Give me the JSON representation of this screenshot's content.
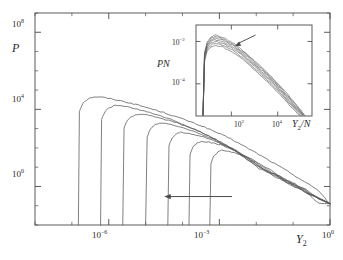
{
  "figure": {
    "type": "scientific-plot",
    "background": "#ffffff",
    "line_color": "#555555",
    "axis_color": "#4a4a4a"
  },
  "main_plot": {
    "ylabel": "P",
    "xlabel_base": "Y",
    "xlabel_sub": "2",
    "y_ticks": [
      {
        "mantissa": "10",
        "exp": "8",
        "value": 100000000.0
      },
      {
        "mantissa": "10",
        "exp": "4",
        "value": 10000.0
      },
      {
        "mantissa": "10",
        "exp": "0",
        "value": 1.0
      }
    ],
    "x_ticks": [
      {
        "mantissa": "10",
        "exp": "−6",
        "value": 1e-06
      },
      {
        "mantissa": "10",
        "exp": "−3",
        "value": 0.001
      },
      {
        "mantissa": "10",
        "exp": "0",
        "value": 1.0
      }
    ],
    "arrow": {
      "name": "increasing-n-arrow",
      "direction": "left"
    }
  },
  "inset_plot": {
    "ylabel_base": "PN",
    "xlabel_base": "Y",
    "xlabel_sub": "2",
    "xlabel_suffix": "/N",
    "y_ticks": [
      {
        "mantissa": "10",
        "exp": "−2",
        "value": 0.01
      },
      {
        "mantissa": "10",
        "exp": "−4",
        "value": 0.0001
      }
    ],
    "x_ticks": [
      {
        "mantissa": "10",
        "exp": "2",
        "value": 100.0
      },
      {
        "mantissa": "10",
        "exp": "4",
        "value": 10000.0
      }
    ],
    "arrow": {
      "name": "collapse-arrow",
      "direction": "down-left"
    }
  },
  "chart_data": {
    "type": "line",
    "title": "",
    "xlabel": "Y_2",
    "ylabel": "P",
    "xscale": "log",
    "yscale": "log",
    "xlim": [
      1e-08,
      1.0
    ],
    "ylim": [
      0.01,
      1000000000.0
    ],
    "grid": false,
    "legend": "none",
    "annotations": [
      {
        "text": "arrow pointing left, indicating increasing N",
        "x": 1e-05,
        "y": 0.3
      },
      {
        "text": "inset arrow pointing down-left at collapsed curve bundle"
      }
    ],
    "series": [
      {
        "name": "N1",
        "cutoff_x": 1.5e-07,
        "peak_x": 4e-07,
        "peak_y": 45000.0,
        "x": [
          1.5e-07,
          1.6e-07,
          2e-07,
          2.8e-07,
          4e-07,
          7e-07,
          1.5e-06,
          4e-06,
          1e-05,
          3e-05,
          0.0001,
          0.0004,
          0.002,
          0.01,
          0.06,
          0.2,
          0.5,
          1.0
        ],
        "y": [
          0.01,
          8000.0,
          22000.0,
          36000.0,
          45000.0,
          42000.0,
          32000.0,
          21000.0,
          13000.0,
          7000.0,
          3200.0,
          1200.0,
          300.0,
          55.0,
          7.5,
          1.8,
          0.6,
          0.12
        ]
      },
      {
        "name": "N2",
        "cutoff_x": 6e-07,
        "peak_x": 1.5e-06,
        "peak_y": 16000.0,
        "x": [
          6e-07,
          6.4e-07,
          8e-07,
          1.1e-06,
          1.5e-06,
          2.6e-06,
          6e-06,
          1.5e-05,
          5e-05,
          0.00015,
          0.0006,
          0.0025,
          0.012,
          0.06,
          0.2,
          0.5,
          1.0
        ],
        "y": [
          0.01,
          3000.0,
          8000.0,
          13000.0,
          16000.0,
          14500.0,
          10000.0,
          6200.0,
          2900.0,
          1250.0,
          360.0,
          80.0,
          8.5,
          2.0,
          0.65,
          0.13,
          0.13
        ]
      },
      {
        "name": "N3",
        "cutoff_x": 2.4e-06,
        "peak_x": 6e-06,
        "peak_y": 5500.0,
        "x": [
          2.4e-06,
          2.6e-06,
          3.2e-06,
          4.4e-06,
          6e-06,
          1.1e-05,
          2.5e-05,
          7e-05,
          0.00022,
          0.0008,
          0.003,
          0.014,
          0.07,
          0.22,
          0.5,
          1.0
        ],
        "y": [
          0.01,
          1100.0,
          2800.0,
          4500.0,
          5500.0,
          5000.0,
          3500.0,
          2000.0,
          900.0,
          280.0,
          68.0,
          9.0,
          2.2,
          0.7,
          0.22,
          0.13
        ]
      },
      {
        "name": "N4",
        "cutoff_x": 1e-05,
        "peak_x": 2.4e-05,
        "peak_y": 1900.0,
        "x": [
          1e-05,
          1.1e-05,
          1.35e-05,
          1.8e-05,
          2.4e-05,
          4.2e-05,
          9e-05,
          0.00024,
          0.0007,
          0.0024,
          0.01,
          0.05,
          0.18,
          0.5,
          1.0
        ],
        "y": [
          0.01,
          380.0,
          950.0,
          1550.0,
          1900.0,
          1700.0,
          1200.0,
          650.0,
          270.0,
          80.0,
          12.0,
          2.6,
          0.8,
          0.23,
          0.13
        ]
      },
      {
        "name": "N5",
        "cutoff_x": 4e-05,
        "peak_x": 9e-05,
        "peak_y": 650.0,
        "x": [
          4e-05,
          4.3e-05,
          5.2e-05,
          6.9e-05,
          9e-05,
          0.00015,
          0.00032,
          0.0008,
          0.0022,
          0.007,
          0.03,
          0.12,
          0.4,
          1.0
        ],
        "y": [
          0.01,
          130.0,
          330.0,
          530.0,
          650.0,
          590.0,
          410.0,
          220.0,
          90.0,
          24.0,
          3.4,
          0.95,
          0.3,
          0.13
        ]
      },
      {
        "name": "N6",
        "cutoff_x": 0.00015,
        "peak_x": 0.00032,
        "peak_y": 220.0,
        "x": [
          0.00015,
          0.00016,
          0.00019,
          0.00025,
          0.00032,
          0.00052,
          0.0011,
          0.0026,
          0.007,
          0.022,
          0.08,
          0.3,
          1.0
        ],
        "y": [
          0.01,
          45.0,
          110.0,
          180.0,
          220.0,
          200.0,
          140.0,
          75.0,
          27.0,
          6.5,
          1.3,
          0.36,
          0.13
        ]
      },
      {
        "name": "N7",
        "cutoff_x": 0.00055,
        "peak_x": 0.00115,
        "peak_y": 75.0,
        "x": [
          0.00055,
          0.00059,
          0.0007,
          0.00092,
          0.00115,
          0.0018,
          0.0036,
          0.008,
          0.022,
          0.07,
          0.24,
          1.0
        ],
        "y": [
          0.01,
          16.0,
          38.0,
          62.0,
          75.0,
          68.0,
          47.0,
          25.0,
          8.0,
          1.9,
          0.45,
          0.13
        ]
      }
    ],
    "inset": {
      "type": "line",
      "xlabel": "Y_2/N",
      "ylabel": "PN",
      "xscale": "log",
      "yscale": "log",
      "xlim": [
        3.0,
        300000.0
      ],
      "ylim": [
        3e-06,
        0.06
      ],
      "grid": false,
      "description": "Scaling collapse: the same seven distributions replotted as PN versus Y_2/N fall onto a single master curve with a shared peak near Y_2/N ~ 20 and a common power-law tail.",
      "series": [
        {
          "name": "N1",
          "peak_y": 0.02,
          "x": [
            6,
            7,
            9,
            13,
            20,
            40,
            110.0,
            350.0,
            1200.0,
            4500.0,
            16000.0,
            60000.0,
            160000.0
          ],
          "y": [
            3e-06,
            0.003,
            0.009,
            0.016,
            0.02,
            0.016,
            0.009,
            0.0034,
            0.001,
            0.00026,
            6e-05,
            1.1e-05,
            3e-06
          ]
        },
        {
          "name": "N2",
          "peak_y": 0.017,
          "x": [
            6,
            7,
            9,
            13,
            20,
            40,
            110.0,
            350.0,
            1200.0,
            4500.0,
            16000.0,
            60000.0,
            150000.0
          ],
          "y": [
            3e-06,
            0.0026,
            0.0078,
            0.0138,
            0.017,
            0.0138,
            0.0078,
            0.003,
            0.0009,
            0.00023,
            5.2e-05,
            9.5e-06,
            3e-06
          ]
        },
        {
          "name": "N3",
          "peak_y": 0.0145,
          "x": [
            6,
            7,
            9,
            13,
            20,
            40,
            110.0,
            350.0,
            1200.0,
            4500.0,
            16000.0,
            60000.0,
            140000.0
          ],
          "y": [
            3e-06,
            0.0023,
            0.0068,
            0.012,
            0.0145,
            0.012,
            0.0068,
            0.0026,
            0.00078,
            0.0002,
            4.5e-05,
            8.5e-06,
            3e-06
          ]
        },
        {
          "name": "N4",
          "peak_y": 0.012,
          "x": [
            6,
            7,
            9,
            13,
            20,
            40,
            110.0,
            350.0,
            1200.0,
            4500.0,
            16000.0,
            60000.0,
            130000.0
          ],
          "y": [
            3e-06,
            0.002,
            0.0058,
            0.01,
            0.012,
            0.01,
            0.0058,
            0.0022,
            0.00066,
            0.00017,
            3.9e-05,
            7.5e-06,
            3e-06
          ]
        },
        {
          "name": "N5",
          "peak_y": 0.01,
          "x": [
            6,
            7,
            9,
            13,
            20,
            40,
            110.0,
            350.0,
            1200.0,
            4500.0,
            16000.0,
            60000.0,
            120000.0
          ],
          "y": [
            3e-06,
            0.0017,
            0.0049,
            0.0084,
            0.01,
            0.0084,
            0.0049,
            0.0019,
            0.00056,
            0.000145,
            3.3e-05,
            6.5e-06,
            3e-06
          ]
        },
        {
          "name": "N6",
          "peak_y": 0.008,
          "x": [
            6,
            7,
            9,
            13,
            20,
            40,
            110.0,
            350.0,
            1200.0,
            4500.0,
            16000.0,
            60000.0,
            110000.0
          ],
          "y": [
            3e-06,
            0.0014,
            0.004,
            0.0068,
            0.008,
            0.0068,
            0.004,
            0.00155,
            0.00046,
            0.00012,
            2.8e-05,
            5.5e-06,
            3e-06
          ]
        },
        {
          "name": "N7",
          "peak_y": 0.0065,
          "x": [
            6,
            7,
            9,
            13,
            20,
            40,
            110.0,
            350.0,
            1200.0,
            4500.0,
            16000.0,
            60000.0,
            100000.0
          ],
          "y": [
            3e-06,
            0.00115,
            0.0033,
            0.0056,
            0.0065,
            0.0056,
            0.0033,
            0.0013,
            0.00038,
            0.0001,
            2.3e-05,
            4.6e-06,
            3e-06
          ]
        }
      ]
    }
  }
}
